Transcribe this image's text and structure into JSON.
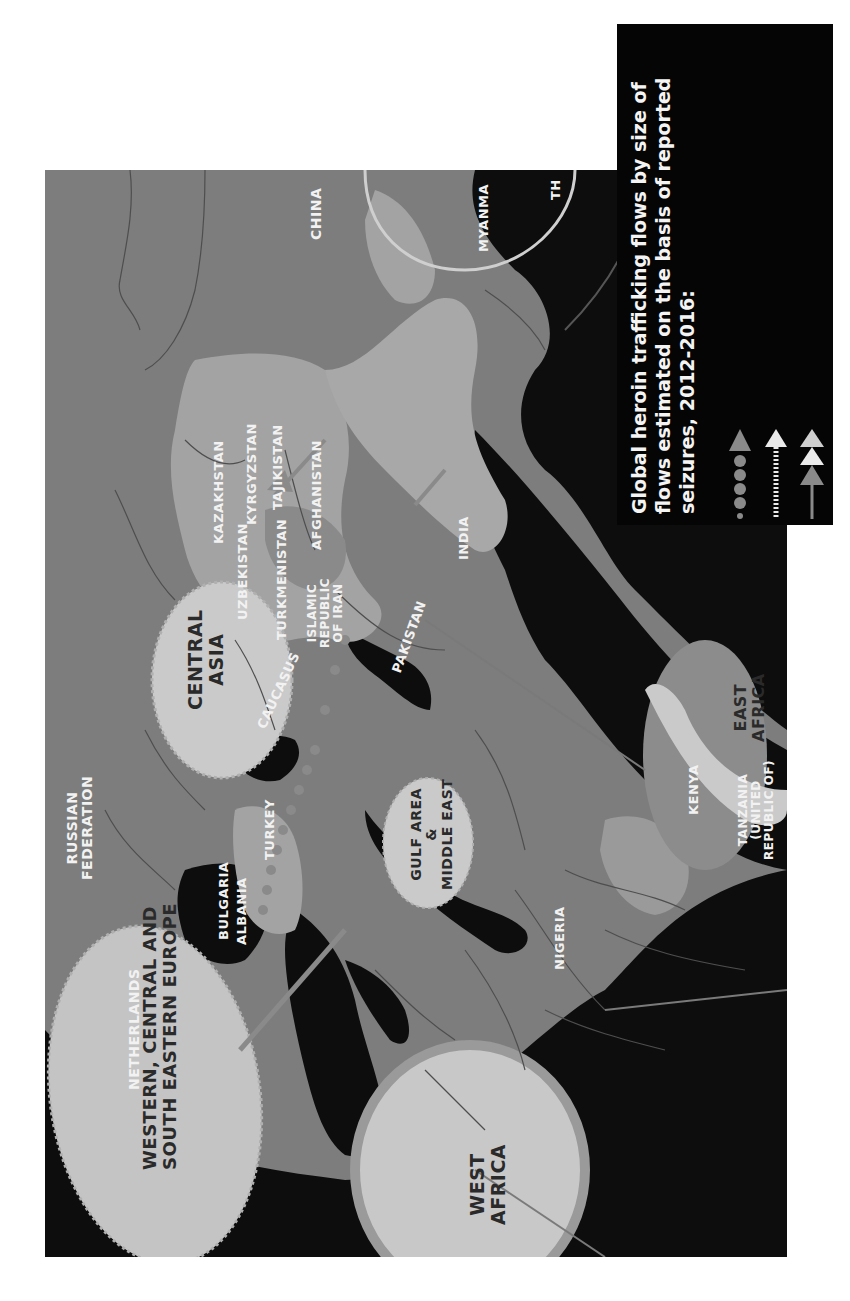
{
  "legend": {
    "title_lines": [
      "Global heroin trafficking flows by size of",
      "flows estimated on the basis of reported",
      "seizures, 2012-2016:"
    ],
    "symbols": [
      {
        "name": "dotted-arrow-icon",
        "style": "grey dots with grey arrowhead"
      },
      {
        "name": "dashed-arrow-icon",
        "style": "white dashed line with white arrowhead"
      },
      {
        "name": "multi-head-arrow-icon",
        "style": "stacked white and grey arrowheads"
      }
    ]
  },
  "regions": {
    "western_europe": {
      "lines": [
        "WESTERN, CENTRAL AND",
        "SOUTH EASTERN EUROPE"
      ]
    },
    "west_africa": {
      "lines": [
        "WEST",
        "AFRICA"
      ]
    },
    "central_asia": {
      "lines": [
        "CENTRAL",
        "ASIA"
      ]
    },
    "gulf_area": {
      "lines": [
        "GULF AREA",
        "&",
        "MIDDLE EAST"
      ]
    },
    "east_africa": {
      "lines": [
        "EAST",
        "AFRICA"
      ]
    }
  },
  "countries": {
    "china": "CHINA",
    "myanmar": "MYANMA",
    "thailand": "TH",
    "india": "INDIA",
    "pakistan": "PAKISTAN",
    "tajikistan": "TAJIKISTAN",
    "kyrgyzstan": "KYRGYZSTAN",
    "kazakhstan": "KAZAKHSTAN",
    "afghanistan": "AFGHANISTAN",
    "uzbekistan": "UZBEKISTAN",
    "turkmenistan": "TURKMENISTAN",
    "iran": [
      "ISLAMIC",
      "REPUBLIC",
      "OF IRAN"
    ],
    "caucasus": "CAUCASUS",
    "russia": [
      "RUSSIAN",
      "FEDERATION"
    ],
    "turkey": "TURKEY",
    "bulgaria": "BULGARIA",
    "albania": "ALBANIA",
    "netherlands": "NETHERLANDS",
    "nigeria": "NIGERIA",
    "kenya": "KENYA",
    "tanzania": [
      "TANZANIA",
      "(UNITED",
      "REPUBLIC OF)"
    ]
  },
  "colors": {
    "land": "#7d7d7d",
    "highlight_land": "#a6a6a6",
    "region_ellipse": "#c9c9c9",
    "sea": "#0d0d0d",
    "legend_bg": "#050505",
    "flow_grey": "#8a8a8a",
    "flow_white": "#eaeaea"
  }
}
